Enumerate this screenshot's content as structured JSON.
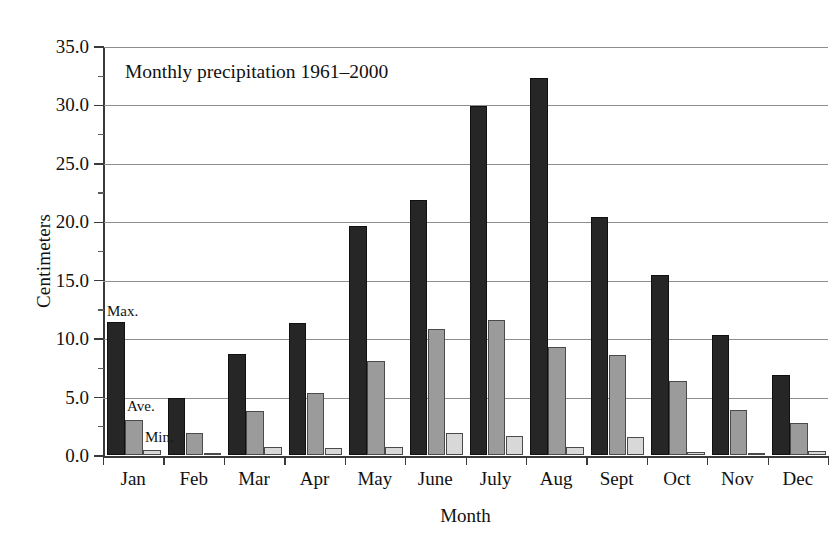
{
  "chart_data": {
    "type": "bar",
    "title": "Monthly precipitation 1961–2000",
    "xlabel": "Month",
    "ylabel": "Centimeters",
    "categories": [
      "Jan",
      "Feb",
      "Mar",
      "Apr",
      "May",
      "June",
      "July",
      "Aug",
      "Sept",
      "Oct",
      "Nov",
      "Dec"
    ],
    "series": [
      {
        "name": "Max.",
        "color": "#262626",
        "values": [
          11.4,
          4.9,
          8.7,
          11.3,
          19.6,
          21.9,
          29.9,
          32.3,
          20.4,
          15.4,
          10.3,
          6.9
        ]
      },
      {
        "name": "Ave.",
        "color": "#9b9b9b",
        "values": [
          3.0,
          1.9,
          3.8,
          5.3,
          8.1,
          10.8,
          11.6,
          9.3,
          8.6,
          6.4,
          3.9,
          2.8
        ]
      },
      {
        "name": "Min.",
        "color": "#d8d8d8",
        "values": [
          0.5,
          0.05,
          0.7,
          0.6,
          0.7,
          1.9,
          1.7,
          0.7,
          1.6,
          0.3,
          0.05,
          0.4
        ]
      }
    ],
    "ylim": [
      0.0,
      35.0
    ],
    "ytick_labels": [
      "0.0",
      "5.0",
      "10.0",
      "15.0",
      "20.0",
      "25.0",
      "30.0",
      "35.0"
    ],
    "ytick_values": [
      0.0,
      5.0,
      10.0,
      15.0,
      20.0,
      25.0,
      30.0,
      35.0
    ],
    "minor_ytick_values": [
      2.5,
      7.5,
      12.5,
      17.5,
      22.5,
      27.5,
      32.5
    ],
    "grid": true,
    "grid_axis": "y",
    "legend": "inline-annotations",
    "annotations": [
      {
        "id": "max",
        "text": "Max."
      },
      {
        "id": "ave",
        "text": "Ave."
      },
      {
        "id": "min",
        "text": "Min."
      }
    ]
  }
}
